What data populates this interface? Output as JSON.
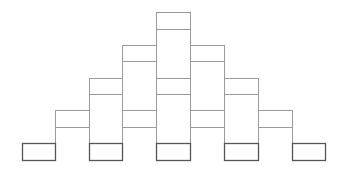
{
  "diagram": {
    "title": "",
    "colors": {
      "background": "#ffffff",
      "stroke_light": "#9a9a9a",
      "stroke_dark": "#555555"
    },
    "columns_x": [
      22,
      55,
      89,
      122,
      156,
      190,
      224,
      258,
      292,
      325
    ],
    "rows_y": [
      12,
      29,
      45,
      61,
      78,
      94,
      110,
      127,
      143,
      160
    ],
    "bins": [
      {
        "id": "bin-1",
        "x": 22,
        "y": 143,
        "w": 33,
        "h": 17
      },
      {
        "id": "bin-2",
        "x": 89,
        "y": 143,
        "w": 33,
        "h": 17
      },
      {
        "id": "bin-3",
        "x": 156,
        "y": 143,
        "w": 34,
        "h": 17
      },
      {
        "id": "bin-4",
        "x": 224,
        "y": 143,
        "w": 34,
        "h": 17
      },
      {
        "id": "bin-5",
        "x": 292,
        "y": 143,
        "w": 33,
        "h": 17
      }
    ],
    "cells": [
      {
        "id": "r0-c0",
        "x": 156,
        "y": 12,
        "w": 34,
        "h": 17
      },
      {
        "id": "r1-c0",
        "x": 122,
        "y": 45,
        "w": 34,
        "h": 16
      },
      {
        "id": "r1-c1",
        "x": 190,
        "y": 45,
        "w": 34,
        "h": 16
      },
      {
        "id": "r2-c0",
        "x": 89,
        "y": 78,
        "w": 33,
        "h": 16
      },
      {
        "id": "r2-c1",
        "x": 156,
        "y": 78,
        "w": 34,
        "h": 16
      },
      {
        "id": "r2-c2",
        "x": 224,
        "y": 78,
        "w": 34,
        "h": 16
      },
      {
        "id": "r3-c0",
        "x": 55,
        "y": 110,
        "w": 34,
        "h": 17
      },
      {
        "id": "r3-c1",
        "x": 122,
        "y": 110,
        "w": 34,
        "h": 17
      },
      {
        "id": "r3-c2",
        "x": 190,
        "y": 110,
        "w": 34,
        "h": 17
      },
      {
        "id": "r3-c3",
        "x": 258,
        "y": 110,
        "w": 34,
        "h": 17
      }
    ],
    "columns": [
      {
        "id": "col-center",
        "x": 156,
        "y": 29,
        "w": 34,
        "h": 114
      },
      {
        "id": "col-left-1",
        "x": 122,
        "y": 61,
        "w": 34,
        "h": 49
      },
      {
        "id": "col-right-1",
        "x": 190,
        "y": 61,
        "w": 34,
        "h": 49
      },
      {
        "id": "col-left-2",
        "x": 89,
        "y": 94,
        "w": 33,
        "h": 49
      },
      {
        "id": "col-right-2",
        "x": 224,
        "y": 94,
        "w": 34,
        "h": 49
      },
      {
        "id": "col-left-1b",
        "x": 122,
        "y": 127,
        "w": 0,
        "h": 16
      },
      {
        "id": "col-right-1b",
        "x": 224,
        "y": 127,
        "w": 0,
        "h": 16
      }
    ]
  }
}
